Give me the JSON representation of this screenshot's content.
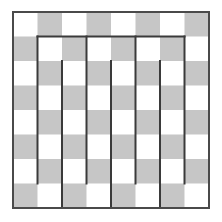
{
  "diagram": {
    "type": "checkerboard-maze",
    "grid": {
      "rows": 8,
      "cols": 8
    },
    "origin": {
      "x": 13,
      "y": 12
    },
    "cell_size": 24.5,
    "colors": {
      "light": "#ffffff",
      "dark": "#c6c6c6",
      "wall": "#3a3a3a",
      "border": "#4a4a4a"
    },
    "first_cell_is_light": true,
    "walls": [
      {
        "orientation": "h",
        "at": 1,
        "from": 1,
        "to": 7
      },
      {
        "orientation": "v",
        "at": 1,
        "from": 1,
        "to": 7
      },
      {
        "orientation": "v",
        "at": 3,
        "from": 1,
        "to": 7
      },
      {
        "orientation": "v",
        "at": 5,
        "from": 1,
        "to": 7
      },
      {
        "orientation": "v",
        "at": 7,
        "from": 1,
        "to": 7
      },
      {
        "orientation": "v",
        "at": 2,
        "from": 2,
        "to": 8
      },
      {
        "orientation": "v",
        "at": 4,
        "from": 2,
        "to": 8
      },
      {
        "orientation": "v",
        "at": 6,
        "from": 2,
        "to": 8
      }
    ]
  }
}
